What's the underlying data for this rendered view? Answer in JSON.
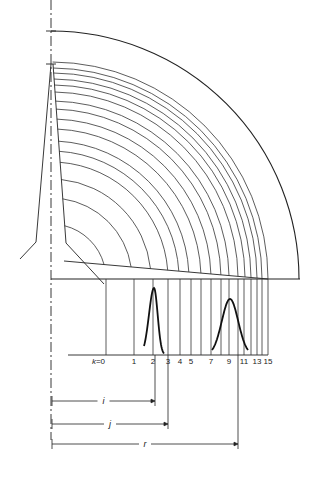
{
  "diagram": {
    "type": "sector-rotor-schematic",
    "colors": {
      "stroke": "#222222",
      "background": "#ffffff"
    },
    "axis": {
      "x": 51,
      "y_top": 0,
      "y_bottom": 440,
      "style": "dash-dot"
    },
    "baseline_y": 279,
    "outer_arc": {
      "cx": 51,
      "cy": 279,
      "r": 248
    },
    "inner_arcs": {
      "cx": 51,
      "cy": 279,
      "radii": [
        55,
        81,
        100,
        117,
        128,
        138,
        150,
        160,
        170,
        178,
        187,
        194,
        200,
        206,
        211,
        217
      ]
    },
    "k_axis": {
      "y": 355,
      "x_start": 68,
      "label_prefix": "k=",
      "ticks": [
        {
          "k": 0,
          "x": 106,
          "label": "k=0"
        },
        {
          "k": 1,
          "x": 134,
          "label": "1"
        },
        {
          "k": 2,
          "x": 153,
          "label": "2"
        },
        {
          "k": 3,
          "x": 168,
          "label": "3"
        },
        {
          "k": 4,
          "x": 180,
          "label": "4"
        },
        {
          "k": 5,
          "x": 191,
          "label": "5"
        },
        {
          "k": 6,
          "x": 201,
          "label": ""
        },
        {
          "k": 7,
          "x": 211,
          "label": "7"
        },
        {
          "k": 8,
          "x": 221,
          "label": ""
        },
        {
          "k": 9,
          "x": 229,
          "label": "9"
        },
        {
          "k": 10,
          "x": 238,
          "label": ""
        },
        {
          "k": 11,
          "x": 244,
          "label": "11"
        },
        {
          "k": 12,
          "x": 251,
          "label": ""
        },
        {
          "k": 13,
          "x": 257,
          "label": "13"
        },
        {
          "k": 14,
          "x": 262,
          "label": ""
        },
        {
          "k": 15,
          "x": 268,
          "label": "15"
        }
      ]
    },
    "peaks": [
      {
        "name": "narrow-peak",
        "center_x": 154,
        "top_y": 288,
        "half_width": 10
      },
      {
        "name": "broad-peak",
        "center_x": 230,
        "top_y": 299,
        "half_width": 18
      }
    ],
    "dimensions": [
      {
        "label": "i",
        "y": 401,
        "x_end": 155
      },
      {
        "label": "j",
        "y": 424,
        "x_end": 168
      },
      {
        "label": "r",
        "y": 444,
        "x_end": 238
      }
    ]
  }
}
